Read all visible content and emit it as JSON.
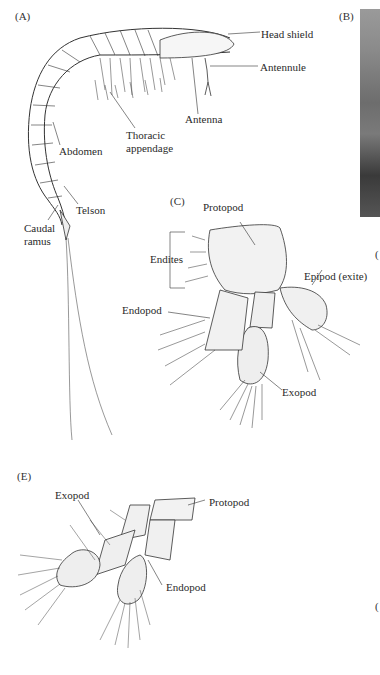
{
  "figure": {
    "panels": [
      {
        "id": "A",
        "label": "(A)",
        "description": "Whole crustacean (lateral view)",
        "annotations": [
          "Head shield",
          "Antennule",
          "Antenna",
          "Thoracic appendage",
          "Abdomen",
          "Telson",
          "Caudal ramus"
        ]
      },
      {
        "id": "B",
        "label": "(B)",
        "description": "Photograph (cropped at right edge)"
      },
      {
        "id": "C",
        "label": "(C)",
        "description": "Phyllopodous limb",
        "annotations": [
          "Protopod",
          "Endites",
          "Epipod (exite)",
          "Endopod",
          "Exopod"
        ]
      },
      {
        "id": "E",
        "label": "(E)",
        "description": "Biramous limb",
        "annotations": [
          "Exopod",
          "Protopod",
          "Endopod"
        ]
      }
    ]
  },
  "labels": {
    "a_panel": "(A)",
    "b_panel": "(B)",
    "c_panel": "(C)",
    "e_panel": "(E)",
    "head_shield": "Head shield",
    "antennule": "Antennule",
    "antenna": "Antenna",
    "thoracic_1": "Thoracic",
    "thoracic_2": "appendage",
    "abdomen": "Abdomen",
    "telson": "Telson",
    "caudal_1": "Caudal",
    "caudal_2": "ramus",
    "c_protopod": "Protopod",
    "c_endites": "Endites",
    "c_epipod": "Epipod (exite)",
    "c_endopod": "Endopod",
    "c_exopod": "Exopod",
    "e_exopod": "Exopod",
    "e_protopod": "Protopod",
    "e_endopod": "Endopod",
    "edge_d": "(",
    "edge_f": "("
  }
}
